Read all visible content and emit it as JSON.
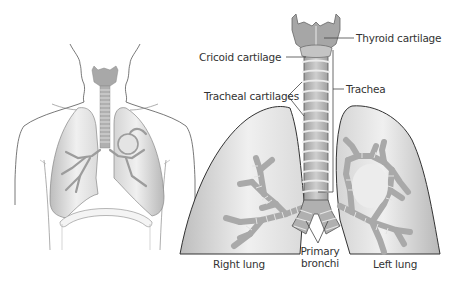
{
  "figure": {
    "panels": {
      "left": {
        "description": "Torso outline showing lungs and trachea in situ"
      },
      "right": {
        "description": "Enlarged view of larynx, trachea, bronchi and lungs"
      }
    },
    "labels": {
      "thyroid_cartilage": "Thyroid cartilage",
      "cricoid_cartilage": "Cricoid cartilage",
      "tracheal_cartilages": "Tracheal cartilages",
      "trachea": "Trachea",
      "right_lung": "Right lung",
      "primary_bronchi_line1": "Primary",
      "primary_bronchi_line2": "bronchi",
      "left_lung": "Left lung"
    },
    "colors": {
      "background": "#ffffff",
      "outline": "#3a3a3a",
      "lung_fill_light": "#f2f2f2",
      "lung_fill_dark": "#bdbdbd",
      "airway_fill": "#b4b4b4",
      "cartilage_ring": "#e6e6e6",
      "label_text": "#333333",
      "leader_line": "#444444"
    }
  }
}
